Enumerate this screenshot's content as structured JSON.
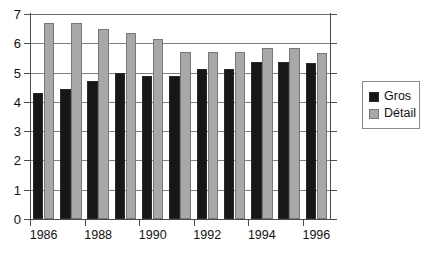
{
  "chart_data": {
    "type": "bar",
    "title": "",
    "subtitle": "",
    "xlabel": "",
    "ylabel": "",
    "categories": [
      "1986",
      "1987",
      "1988",
      "1989",
      "1990",
      "1991",
      "1992",
      "1993",
      "1994",
      "1995",
      "1996"
    ],
    "xtick_labels": [
      "1986",
      "1988",
      "1990",
      "1992",
      "1994",
      "1996"
    ],
    "ytick_labels": [
      "0",
      "1",
      "2",
      "3",
      "4",
      "5",
      "6",
      "7"
    ],
    "ylim": [
      0,
      7
    ],
    "ystep": 1,
    "grid": true,
    "legend_position": "right",
    "series": [
      {
        "name": "Gros",
        "color": "#171717",
        "values": [
          4.3,
          4.45,
          4.7,
          5.0,
          4.9,
          4.88,
          5.12,
          5.12,
          5.35,
          5.35,
          5.32
        ]
      },
      {
        "name": "Détail",
        "color": "#a8a8a8",
        "values": [
          6.7,
          6.7,
          6.5,
          6.35,
          6.13,
          5.7,
          5.7,
          5.7,
          5.85,
          5.85,
          5.67
        ]
      }
    ]
  },
  "legend": {
    "items": [
      {
        "label": "Gros",
        "color": "#171717"
      },
      {
        "label": "Détail",
        "color": "#a8a8a8"
      }
    ]
  },
  "colors": {
    "gros": "#171717",
    "detail": "#a8a8a8",
    "grid": "#808080",
    "axis": "#4d4d4d",
    "text": "#111111",
    "background": "#ffffff"
  }
}
